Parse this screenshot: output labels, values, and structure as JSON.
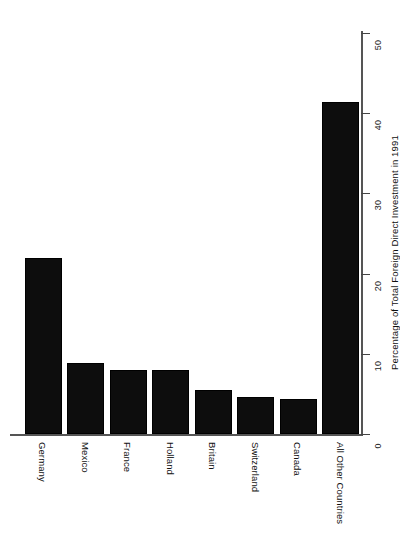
{
  "chart_data": {
    "type": "bar",
    "orientation": "vertical-bars-rotated-90",
    "title": "",
    "subtitle": "",
    "xlabel": "",
    "ylabel": "Percentage of Total Foreign Direct Investment in 1991",
    "categories": [
      "Germany",
      "Mexico",
      "France",
      "Holland",
      "Britain",
      "Switzerland",
      "Canada",
      "All Other Countries"
    ],
    "values": [
      22,
      8.8,
      8,
      8,
      5.5,
      4.6,
      4.4,
      41.4
    ],
    "ylim": [
      0,
      50
    ],
    "yticks": [
      0,
      10,
      20,
      30,
      40,
      50
    ],
    "ytick_labels": [
      "0",
      "10",
      "20",
      "30",
      "40",
      "50"
    ],
    "grid": false,
    "legend": false,
    "bar_color": "#0d0d0d",
    "axis_color": "#555555",
    "background": "#ffffff"
  },
  "axis": {
    "value_axis_title": "Percentage of Total Foreign Direct Investment in 1991"
  }
}
